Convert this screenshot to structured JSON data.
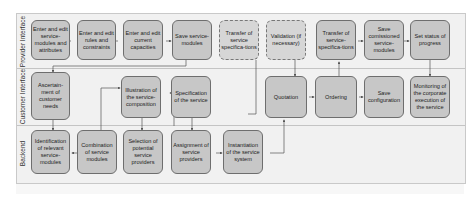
{
  "lanes": [
    {
      "label": "Provider Interface"
    },
    {
      "label": "Customer Interface"
    },
    {
      "label": "Backend"
    }
  ],
  "nodes": {
    "enter_edit_modules": "Enter and edit service-modules and attributes",
    "enter_edit_rules": "Enter and edit rules and constraints",
    "enter_edit_capacities": "Enter and edit current capacities",
    "save_service_modules": "Save service-modules",
    "transfer_specs_1": "Transfer of service specifica-tions",
    "validation": "Validation (if necessary)",
    "transfer_specs_2": "Transfer of service-specifica-tions",
    "save_comissioned": "Save comissioned service-modules",
    "set_status": "Set status of progress",
    "ascertainment": "Ascertain-ment of customer needs",
    "illustration": "Illustration of the service-composition",
    "specification": "Specification of the service",
    "quotation": "Quotation",
    "ordering": "Ordering",
    "save_configuration": "Save configuration",
    "monitoring": "Monitoring of the corporate execution of the service",
    "identification": "Identification of relevant service-modules",
    "combination": "Combination of service modules",
    "selection": "Selection of potential service providers",
    "assignment": "Assignment of service providers",
    "instantiation": "Instantiation of the service system"
  },
  "colors": {
    "node_fill": "#c7c7c7",
    "node_border": "#6e6e6e",
    "lane_bg": "#f1f1f1",
    "connector": "#555555"
  }
}
